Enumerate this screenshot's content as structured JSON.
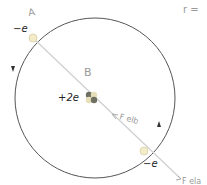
{
  "diagram": {
    "title": "",
    "labels": {
      "point_a": "A",
      "point_b": "B",
      "electron_a_charge": "−e",
      "nucleus_charge": "+2e",
      "electron_b_charge": "−e",
      "force_inward": "F elb",
      "force_outward": "F ela",
      "corner_note": "r ="
    },
    "colors": {
      "orbit": "#555555",
      "axis_line": "#c8c8c8",
      "electron": "#f3eccb",
      "nucleus": "#8a8a7a",
      "handwriting": "#9a9a9a"
    },
    "icons": {
      "orbit_arrow_left": "arrow-down-icon",
      "orbit_arrow_right": "arrow-up-icon"
    }
  }
}
